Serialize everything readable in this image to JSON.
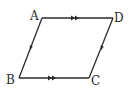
{
  "figure": {
    "shape": "parallelogram",
    "stroke_color": "#2a2a2a",
    "background": "#ffffff",
    "vertices": [
      {
        "label": "A",
        "x": 42,
        "y": 18
      },
      {
        "label": "D",
        "x": 113,
        "y": 18
      },
      {
        "label": "C",
        "x": 89,
        "y": 78
      },
      {
        "label": "B",
        "x": 19,
        "y": 78
      }
    ],
    "labels": {
      "A": "A",
      "B": "B",
      "C": "C",
      "D": "D"
    },
    "edges": [
      {
        "from": "A",
        "to": "D",
        "marker": "double-arrow",
        "direction": "A→D"
      },
      {
        "from": "B",
        "to": "C",
        "marker": "double-arrow",
        "direction": "B→C"
      },
      {
        "from": "A",
        "to": "B",
        "marker": "single-arrow",
        "direction": "A→B"
      },
      {
        "from": "D",
        "to": "C",
        "marker": "single-arrow",
        "direction": "D→C"
      }
    ]
  }
}
